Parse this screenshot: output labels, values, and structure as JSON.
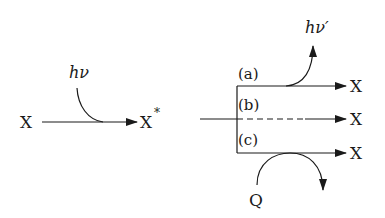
{
  "diagram": {
    "excitation": {
      "reactant": "X",
      "product": "X",
      "product_superscript": "*",
      "photon_label": "hν"
    },
    "deactivation": {
      "pathways": [
        {
          "label": "(a)",
          "product": "X",
          "line_style": "solid",
          "side_output": "hν′"
        },
        {
          "label": "(b)",
          "product": "X",
          "line_style": "dashed",
          "side_output": ""
        },
        {
          "label": "(c)",
          "product": "X",
          "line_style": "solid",
          "side_output": "Q"
        }
      ]
    },
    "colors": {
      "ink": "#1a1a1a",
      "background": "#ffffff"
    }
  }
}
